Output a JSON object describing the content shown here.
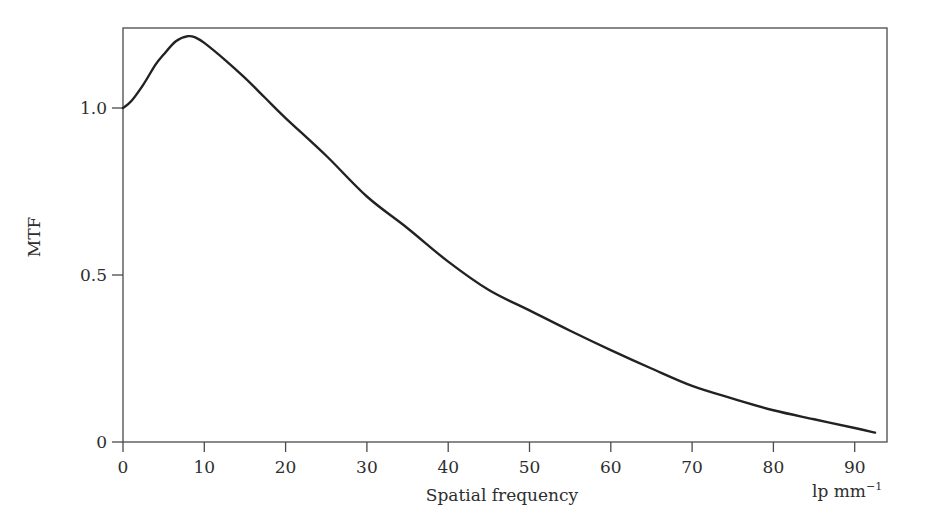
{
  "chart_data": {
    "type": "line",
    "title": "",
    "xlabel": "Spatial frequency",
    "xunit_label": "lp mm",
    "xunit_exponent": "−1",
    "ylabel": "MTF",
    "xlim": [
      0,
      93
    ],
    "ylim": [
      0,
      1.23
    ],
    "grid": false,
    "legend": null,
    "x_ticks": [
      0,
      10,
      20,
      30,
      40,
      50,
      60,
      70,
      80,
      90
    ],
    "x_tick_labels": [
      "0",
      "10",
      "20",
      "30",
      "40",
      "50",
      "60",
      "70",
      "80",
      "90"
    ],
    "y_ticks": [
      0,
      0.5,
      1.0
    ],
    "y_tick_labels": [
      "0",
      "0.5",
      "1.0"
    ],
    "series": [
      {
        "name": "MTF",
        "color": "#222222",
        "x": [
          0,
          1,
          2.5,
          4,
          5,
          6.5,
          8,
          9,
          10,
          12.5,
          15,
          17.5,
          20,
          25,
          30,
          35,
          40,
          45,
          50,
          55,
          60,
          65,
          70,
          75,
          80,
          85,
          90,
          92.5
        ],
        "y": [
          1.0,
          1.02,
          1.07,
          1.13,
          1.16,
          1.2,
          1.215,
          1.21,
          1.195,
          1.145,
          1.09,
          1.03,
          0.97,
          0.857,
          0.735,
          0.64,
          0.54,
          0.455,
          0.394,
          0.333,
          0.275,
          0.22,
          0.168,
          0.13,
          0.095,
          0.068,
          0.042,
          0.028
        ]
      }
    ]
  }
}
